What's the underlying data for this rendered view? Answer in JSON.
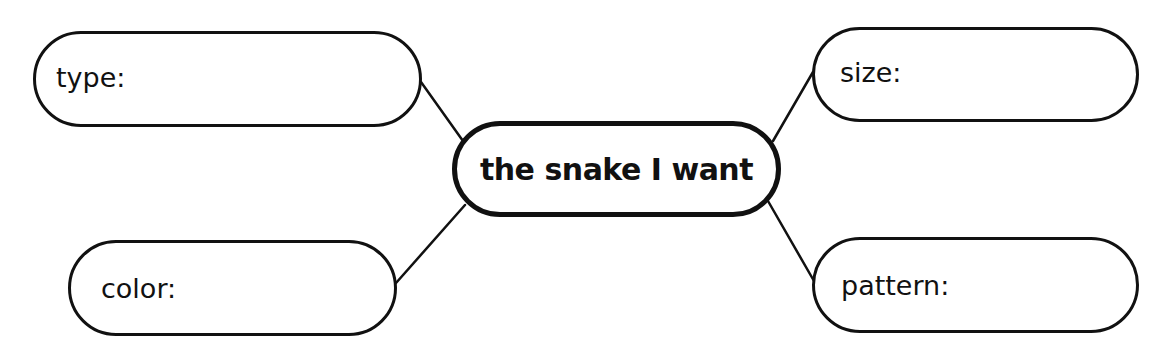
{
  "diagram": {
    "type": "mind-map",
    "center": {
      "label": "the snake I want"
    },
    "branches": [
      {
        "id": "type",
        "label": "type:",
        "value": ""
      },
      {
        "id": "size",
        "label": "size:",
        "value": ""
      },
      {
        "id": "color",
        "label": "color:",
        "value": ""
      },
      {
        "id": "pattern",
        "label": "pattern:",
        "value": ""
      }
    ],
    "colors": {
      "stroke": "#111111",
      "background": "#ffffff",
      "text": "#111111"
    }
  }
}
